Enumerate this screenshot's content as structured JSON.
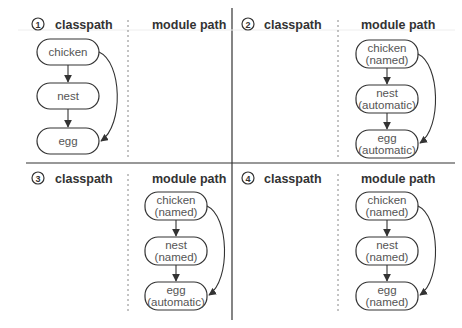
{
  "headers": {
    "classpath": "classpath",
    "module_path": "module path"
  },
  "panels": [
    {
      "number": "1",
      "classpath_nodes": [
        {
          "name": "chicken",
          "type": ""
        },
        {
          "name": "nest",
          "type": ""
        },
        {
          "name": "egg",
          "type": ""
        }
      ],
      "module_nodes": []
    },
    {
      "number": "2",
      "classpath_nodes": [],
      "module_nodes": [
        {
          "name": "chicken",
          "type": "(named)"
        },
        {
          "name": "nest",
          "type": "(automatic)"
        },
        {
          "name": "egg",
          "type": "(automatic)"
        }
      ]
    },
    {
      "number": "3",
      "classpath_nodes": [],
      "module_nodes": [
        {
          "name": "chicken",
          "type": "(named)"
        },
        {
          "name": "nest",
          "type": "(named)"
        },
        {
          "name": "egg",
          "type": "(automatic)"
        }
      ]
    },
    {
      "number": "4",
      "classpath_nodes": [],
      "module_nodes": [
        {
          "name": "chicken",
          "type": "(named)"
        },
        {
          "name": "nest",
          "type": "(named)"
        },
        {
          "name": "egg",
          "type": "(named)"
        }
      ]
    }
  ]
}
